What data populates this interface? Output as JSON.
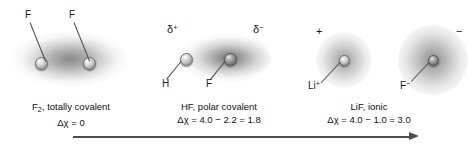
{
  "figure": {
    "background_color": "#ffffff",
    "width": 475,
    "height": 150
  },
  "panels": [
    {
      "id": "f2",
      "molecule": "F2",
      "bond_type": "totally covalent",
      "caption_line1_prefix": "F",
      "caption_line1_sub": "2",
      "caption_line1_suffix": ", totally covalent",
      "caption_line2": "Δχ = 0",
      "electronegativity_difference": 0,
      "atom_labels": [
        "F",
        "F"
      ],
      "charge_labels": [],
      "cloud_shape": "symmetric ellipse",
      "cloud_color": "#5a5a5c"
    },
    {
      "id": "hf",
      "molecule": "HF",
      "bond_type": "polar covalent",
      "caption_line1": "HF, polar covalent",
      "caption_line2": "Δχ = 4.0 − 2.2 = 1.8",
      "electronegativity_difference": 1.8,
      "electronegativity_values": [
        4.0,
        2.2
      ],
      "atom_labels": [
        "H",
        "F"
      ],
      "charge_labels": [
        "δ",
        "δ"
      ],
      "charge_signs": [
        "+",
        "−"
      ],
      "cloud_shape": "asymmetric ellipse shifted toward F",
      "cloud_color": "#4e4e50"
    },
    {
      "id": "lif",
      "molecule": "LiF",
      "bond_type": "ionic",
      "caption_line1": "LiF, ionic",
      "caption_line2": "Δχ = 4.0 − 1.0 = 3.0",
      "electronegativity_difference": 3.0,
      "electronegativity_values": [
        4.0,
        1.0
      ],
      "atom_labels": [
        "Li",
        "F"
      ],
      "atom_label_signs": [
        "+",
        "−"
      ],
      "charge_labels": [
        "+",
        "−"
      ],
      "cloud_shape": "two separate spheres",
      "cloud_color": "#58585a"
    }
  ],
  "axis": {
    "name": "bonding continuum arrow",
    "direction": "left-to-right",
    "color": "#4d4d4d"
  }
}
